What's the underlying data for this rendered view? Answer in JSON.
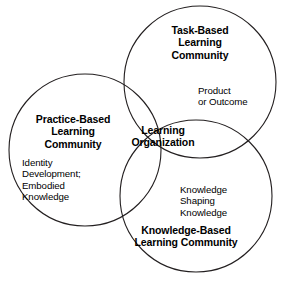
{
  "diagram": {
    "type": "venn-three-circle",
    "background_color": "#ffffff",
    "stroke_color": "#231f20",
    "stroke_width": 1.1,
    "circles": [
      {
        "name": "practice-based-learning-community",
        "cx": 85,
        "cy": 150,
        "r": 76,
        "title": "Practice-Based\nLearning\nCommunity",
        "attribute": "Identity\nDevelopment;\nEmbodied\nKnowledge"
      },
      {
        "name": "task-based-learning-community",
        "cx": 200,
        "cy": 82,
        "r": 76,
        "title": "Task-Based\nLearning\nCommunity",
        "attribute": "Product\nor Outcome"
      },
      {
        "name": "knowledge-based-learning-community",
        "cx": 196,
        "cy": 196,
        "r": 76,
        "title": "Knowledge-Based\nLearning Community",
        "attribute": "Knowledge\nShaping\nKnowledge"
      }
    ],
    "intersection": {
      "name": "learning-organization",
      "label": "Learning\nOrganization"
    }
  }
}
